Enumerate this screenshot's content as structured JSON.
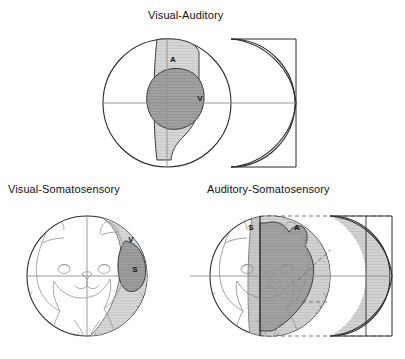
{
  "figure": {
    "background": "#ffffff",
    "width": 405,
    "height": 359,
    "stroke_dark": "#2b2b2b",
    "stroke_mid": "#777777",
    "stroke_light": "#9a9a9a",
    "fill_light_gray": "#d4d4d4",
    "fill_mid_gray": "#b8b8b8",
    "fill_dark_gray": "#9d9d9d",
    "fill_white": "#ffffff"
  },
  "panels": [
    {
      "id": "visual-auditory",
      "title": "Visual-Auditory",
      "region_labels": [
        {
          "key": "A",
          "text": "A",
          "meaning": "auditory-field",
          "x": 173,
          "y": 62
        },
        {
          "key": "V",
          "text": "V",
          "meaning": "visual-field",
          "x": 200,
          "y": 101
        }
      ],
      "has_cat_head": false,
      "has_dashed_guides": false
    },
    {
      "id": "visual-somatosensory",
      "title": "Visual-Somatosensory",
      "region_labels": [
        {
          "key": "V",
          "text": "V",
          "meaning": "visual-field",
          "x": 131,
          "y": 242
        },
        {
          "key": "S",
          "text": "S",
          "meaning": "somatosensory-field",
          "x": 135,
          "y": 272
        }
      ],
      "has_cat_head": true,
      "has_dashed_guides": false
    },
    {
      "id": "auditory-somatosensory",
      "title": "Auditory-Somatosensory",
      "region_labels": [
        {
          "key": "S",
          "text": "S",
          "meaning": "somatosensory-field",
          "x": 251,
          "y": 246
        },
        {
          "key": "A",
          "text": "A",
          "meaning": "auditory-field",
          "x": 297,
          "y": 246
        }
      ],
      "has_cat_head": true,
      "has_dashed_guides": true
    }
  ],
  "legend_keys": [
    {
      "symbol": "A",
      "name": "Auditory"
    },
    {
      "symbol": "V",
      "name": "Visual"
    },
    {
      "symbol": "S",
      "name": "Somatosensory"
    }
  ]
}
